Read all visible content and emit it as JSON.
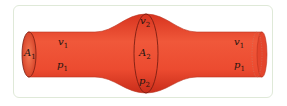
{
  "diagram": {
    "type": "fluid-flow-tube",
    "colors": {
      "tube": "#e8452f",
      "tube_light": "#f36b4a",
      "tube_dark": "#c62a18",
      "outline": "#7a1e12",
      "frame": "#dfe9d8"
    },
    "left_section": {
      "area": "A",
      "area_sub": "1",
      "velocity": "v",
      "velocity_sub": "1",
      "pressure": "p",
      "pressure_sub": "1"
    },
    "center_section": {
      "area": "A",
      "area_sub": "2",
      "velocity": "v",
      "velocity_sub": "2",
      "pressure": "p",
      "pressure_sub": "2"
    },
    "right_section": {
      "velocity": "v",
      "velocity_sub": "1",
      "pressure": "p",
      "pressure_sub": "1"
    }
  }
}
